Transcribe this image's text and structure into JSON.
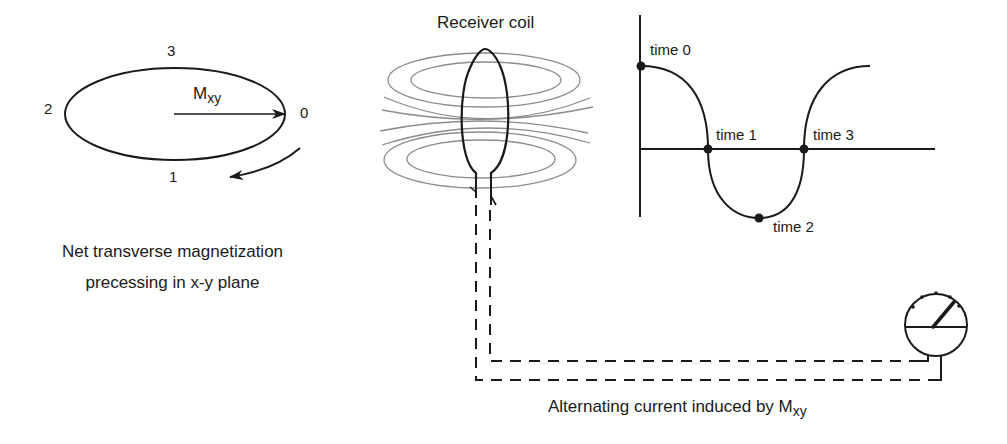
{
  "precession": {
    "vector_label_main": "M",
    "vector_label_sub": "xy",
    "positions": [
      {
        "id": "0",
        "label": "0"
      },
      {
        "id": "1",
        "label": "1"
      },
      {
        "id": "2",
        "label": "2"
      },
      {
        "id": "3",
        "label": "3"
      }
    ],
    "caption_line1": "Net transverse magnetization",
    "caption_line2": "precessing in x-y plane"
  },
  "coil": {
    "title": "Receiver coil"
  },
  "waveform": {
    "points": [
      {
        "label": "time 0"
      },
      {
        "label": "time 1"
      },
      {
        "label": "time 2"
      },
      {
        "label": "time 3"
      }
    ]
  },
  "meter": {
    "caption_main": "Alternating current induced by M",
    "caption_sub": "xy"
  },
  "colors": {
    "ink": "#1a1a1a",
    "field_lines": "#8a8a8a",
    "background": "#ffffff"
  }
}
